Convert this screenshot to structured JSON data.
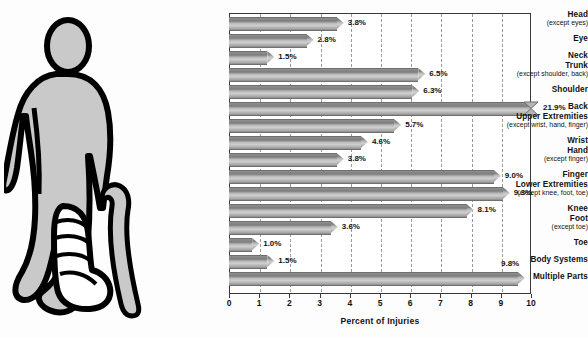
{
  "chart_data": {
    "type": "bar",
    "orientation": "horizontal",
    "title": "",
    "xlabel": "Percent of Injuries",
    "ylabel": "",
    "xlim": [
      0,
      10
    ],
    "xticks": [
      0,
      1,
      2,
      3,
      4,
      5,
      6,
      7,
      8,
      9,
      10
    ],
    "xtick_labels": [
      "0",
      "1",
      "2",
      "3",
      "4",
      "5",
      "6",
      "7",
      "8",
      "9",
      "10"
    ],
    "grid": true,
    "grid_style": "dashed-vertical",
    "legend": "none",
    "value_suffix": "%",
    "categories": [
      "Head (except eyes)",
      "Eye",
      "Neck",
      "Trunk (except shoulder, back)",
      "Shoulder",
      "Back",
      "Upper Extremities (except wrist, hand, finger)",
      "Wrist",
      "Hand (except finger)",
      "Finger",
      "Lower Extremities (except knee, foot, toe)",
      "Knee",
      "Foot (except toe)",
      "Toe",
      "Body Systems",
      "Multiple Parts"
    ],
    "values": [
      3.8,
      2.8,
      1.5,
      6.5,
      6.3,
      21.9,
      5.7,
      4.6,
      3.8,
      9.0,
      9.3,
      8.1,
      3.6,
      1.0,
      1.5,
      9.8
    ],
    "bars": [
      {
        "label": "Head",
        "sublabel": "(except eyes)",
        "value": 3.8,
        "value_label": "3.8%",
        "broken": false
      },
      {
        "label": "Eye",
        "sublabel": "",
        "value": 2.8,
        "value_label": "2.8%",
        "broken": false
      },
      {
        "label": "Neck",
        "sublabel": "",
        "value": 1.5,
        "value_label": "1.5%",
        "broken": false
      },
      {
        "label": "Trunk",
        "sublabel": "(except shoulder, back)",
        "value": 6.5,
        "value_label": "6.5%",
        "broken": false
      },
      {
        "label": "Shoulder",
        "sublabel": "",
        "value": 6.3,
        "value_label": "6.3%",
        "broken": false
      },
      {
        "label": "Back",
        "sublabel": "",
        "value": 21.9,
        "value_label": "21.9%",
        "broken": true
      },
      {
        "label": "Upper Extremities",
        "sublabel": "(except wrist, hand, finger)",
        "value": 5.7,
        "value_label": "5.7%",
        "broken": false
      },
      {
        "label": "Wrist",
        "sublabel": "",
        "value": 4.6,
        "value_label": "4.6%",
        "broken": false
      },
      {
        "label": "Hand",
        "sublabel": "(except finger)",
        "value": 3.8,
        "value_label": "3.8%",
        "broken": false
      },
      {
        "label": "Finger",
        "sublabel": "",
        "value": 9.0,
        "value_label": "9.0%",
        "broken": false
      },
      {
        "label": "Lower Extremities",
        "sublabel": "(except knee, foot, toe)",
        "value": 9.3,
        "value_label": "9.3%",
        "broken": false
      },
      {
        "label": "Knee",
        "sublabel": "",
        "value": 8.1,
        "value_label": "8.1%",
        "broken": false
      },
      {
        "label": "Foot",
        "sublabel": "(except toe)",
        "value": 3.6,
        "value_label": "3.6%",
        "broken": false
      },
      {
        "label": "Toe",
        "sublabel": "",
        "value": 1.0,
        "value_label": "1.0%",
        "broken": false
      },
      {
        "label": "Body Systems",
        "sublabel": "",
        "value": 1.5,
        "value_label": "1.5%",
        "broken": false
      },
      {
        "label": "Multiple Parts",
        "sublabel": "",
        "value": 9.8,
        "value_label": "9.8%",
        "broken": false
      }
    ]
  },
  "illustration": {
    "name": "injured-person-with-cane",
    "description": "Standing human figure with bandaged foot and walking cane",
    "body_color": "#c9c9c9",
    "outline_color": "#000000"
  },
  "colors": {
    "bar_dark": "#7d7d7d",
    "bar_light": "#cfcfcf",
    "bar_outline": "#6f6f6f",
    "grid": "#9a9a9a",
    "frame": "#3a3a3a",
    "text": "#111111",
    "background": "#fdfdfd"
  }
}
